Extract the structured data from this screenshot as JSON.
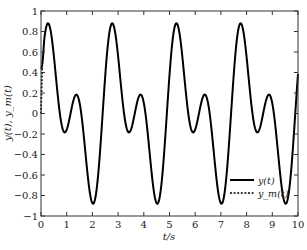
{
  "chart_data": {
    "type": "line",
    "title": "",
    "xlabel": "t/s",
    "ylabel": "y(t), y_m(t)",
    "xlim": [
      0,
      10
    ],
    "ylim": [
      -1,
      1
    ],
    "xticks": [
      0,
      1,
      2,
      3,
      4,
      5,
      6,
      7,
      8,
      9,
      10
    ],
    "yticks": [
      -1,
      -0.8,
      -0.6,
      -0.4,
      -0.2,
      0,
      0.2,
      0.4,
      0.6,
      0.8,
      1
    ],
    "xtick_labels": [
      "0",
      "1",
      "2",
      "3",
      "4",
      "5",
      "6",
      "7",
      "8",
      "9",
      "10"
    ],
    "ytick_labels": [
      "−1",
      "−0.8",
      "−0.6",
      "−0.4",
      "−0.2",
      "0",
      "0.2",
      "0.4",
      "0.6",
      "0.8",
      "1"
    ],
    "grid": false,
    "legend": {
      "position": "lower right",
      "entries": [
        {
          "label": "y(t)",
          "style": "solid"
        },
        {
          "label": "y_m(t)",
          "style": "dashed"
        }
      ]
    },
    "series": [
      {
        "name": "y(t)",
        "style": "solid",
        "color": "#000000",
        "key_points": [
          {
            "t": 0.0,
            "y": 0.45
          },
          {
            "t": 0.35,
            "y": 0.88
          },
          {
            "t": 1.0,
            "y": -0.19
          },
          {
            "t": 1.45,
            "y": 0.18
          },
          {
            "t": 2.12,
            "y": -0.89
          },
          {
            "t": 2.84,
            "y": 0.88
          },
          {
            "t": 3.5,
            "y": -0.19
          },
          {
            "t": 3.95,
            "y": 0.18
          },
          {
            "t": 4.62,
            "y": -0.89
          },
          {
            "t": 5.33,
            "y": 0.88
          },
          {
            "t": 6.0,
            "y": -0.19
          },
          {
            "t": 6.45,
            "y": 0.18
          },
          {
            "t": 7.12,
            "y": -0.89
          },
          {
            "t": 7.82,
            "y": 0.88
          },
          {
            "t": 8.5,
            "y": -0.19
          },
          {
            "t": 8.95,
            "y": 0.18
          },
          {
            "t": 9.62,
            "y": -0.89
          },
          {
            "t": 10.0,
            "y": -0.2
          }
        ],
        "model": {
          "form": "0.5*sin(w*t+p)+0.5*sin(2*(w*t+p))",
          "w": 2.515,
          "p": 0.25
        }
      },
      {
        "name": "y_m(t)",
        "style": "dashed",
        "color": "#000000",
        "key_points": [
          {
            "t": 0.0,
            "y": 0.0
          },
          {
            "t": 0.02,
            "y": 0.2
          },
          {
            "t": 0.05,
            "y": 0.45
          }
        ],
        "note": "converges onto y(t) immediately after t≈0.05"
      }
    ]
  }
}
